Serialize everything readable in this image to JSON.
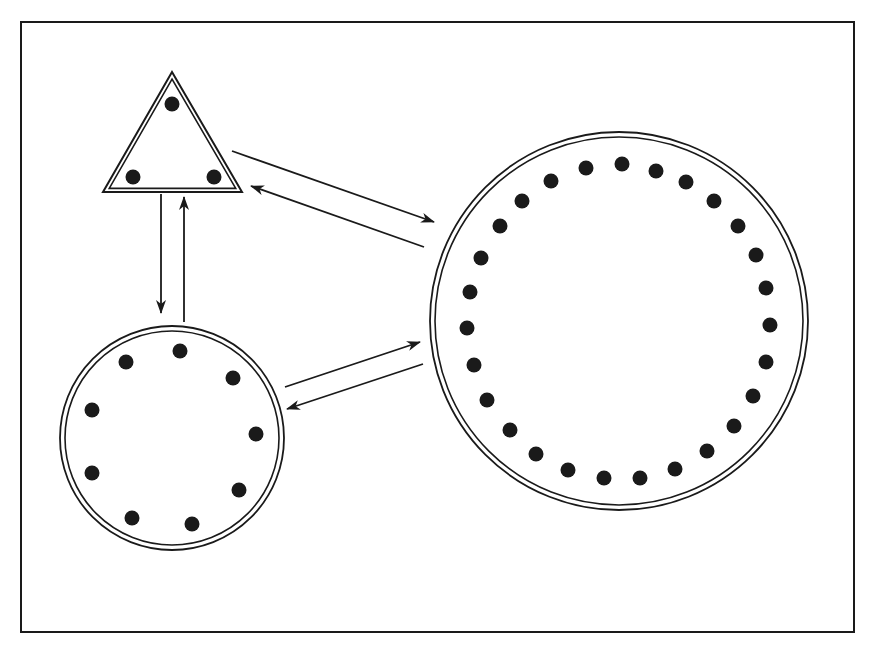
{
  "colors": {
    "ink": "#1a1a1a",
    "background": "#ffffff"
  },
  "frame": {
    "x1": 21,
    "y1": 22,
    "x2": 854,
    "y2": 632
  },
  "nodes": {
    "triangle": {
      "shape": "triangle",
      "vertices": [
        [
          172,
          72
        ],
        [
          103,
          192
        ],
        [
          242,
          192
        ]
      ],
      "dot_count": 3,
      "dots": [
        [
          172,
          104
        ],
        [
          133,
          177
        ],
        [
          214,
          177
        ]
      ]
    },
    "small_circle": {
      "shape": "circle",
      "cx": 172,
      "cy": 438,
      "r": 112,
      "dot_count": 9,
      "dots": [
        [
          180,
          351
        ],
        [
          233,
          378
        ],
        [
          256,
          434
        ],
        [
          239,
          490
        ],
        [
          192,
          524
        ],
        [
          132,
          518
        ],
        [
          92,
          473
        ],
        [
          92,
          410
        ],
        [
          126,
          362
        ]
      ]
    },
    "large_circle": {
      "shape": "circle",
      "cx": 619,
      "cy": 321,
      "r": 189,
      "dot_count": 27,
      "dots": [
        [
          551,
          181
        ],
        [
          586,
          168
        ],
        [
          622,
          164
        ],
        [
          656,
          171
        ],
        [
          686,
          182
        ],
        [
          714,
          201
        ],
        [
          738,
          226
        ],
        [
          756,
          255
        ],
        [
          766,
          288
        ],
        [
          770,
          325
        ],
        [
          766,
          362
        ],
        [
          753,
          396
        ],
        [
          734,
          426
        ],
        [
          707,
          451
        ],
        [
          675,
          469
        ],
        [
          640,
          478
        ],
        [
          604,
          478
        ],
        [
          568,
          470
        ],
        [
          536,
          454
        ],
        [
          510,
          430
        ],
        [
          487,
          400
        ],
        [
          474,
          365
        ],
        [
          467,
          328
        ],
        [
          470,
          292
        ],
        [
          481,
          258
        ],
        [
          500,
          226
        ],
        [
          522,
          201
        ]
      ]
    }
  },
  "edges": [
    {
      "from": "triangle",
      "to": "large_circle",
      "x1": 232,
      "y1": 151,
      "x2": 434,
      "y2": 222
    },
    {
      "from": "large_circle",
      "to": "triangle",
      "x1": 424,
      "y1": 247,
      "x2": 251,
      "y2": 186
    },
    {
      "from": "triangle",
      "to": "small_circle",
      "x1": 161,
      "y1": 194,
      "x2": 161,
      "y2": 313
    },
    {
      "from": "small_circle",
      "to": "triangle",
      "x1": 184,
      "y1": 322,
      "x2": 184,
      "y2": 197
    },
    {
      "from": "small_circle",
      "to": "large_circle",
      "x1": 285,
      "y1": 387,
      "x2": 420,
      "y2": 342
    },
    {
      "from": "large_circle",
      "to": "small_circle",
      "x1": 423,
      "y1": 364,
      "x2": 287,
      "y2": 409
    }
  ]
}
